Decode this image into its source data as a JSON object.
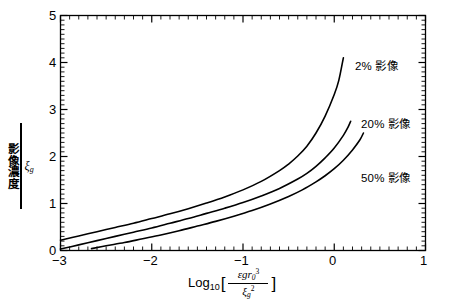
{
  "chart_data": {
    "type": "line",
    "title": "",
    "xlabel": "Log10 [ εgr₀³ / ξ₉² ]",
    "ylabel": "影像濃度 / ξ₉",
    "xlim": [
      -3,
      1
    ],
    "ylim": [
      0,
      5
    ],
    "xticks": [
      -3,
      -2,
      -1,
      0,
      1
    ],
    "xtick_labels": [
      "−3",
      "−2",
      "−1",
      "0",
      "1"
    ],
    "yticks": [
      0,
      1,
      2,
      3,
      4,
      5
    ],
    "ytick_labels": [
      "0",
      "1",
      "2",
      "3",
      "4",
      "5"
    ],
    "x_minor_tick_interval": 0.1,
    "y_minor_tick_interval": 0.1,
    "grid": false,
    "legend_position": "inline-right",
    "series": [
      {
        "name": "2% 影像",
        "label": "2% 影像",
        "color": "#000000",
        "points": [
          [
            -3.0,
            0.22
          ],
          [
            -2.8,
            0.31
          ],
          [
            -2.6,
            0.4
          ],
          [
            -2.4,
            0.49
          ],
          [
            -2.2,
            0.58
          ],
          [
            -2.0,
            0.68
          ],
          [
            -1.8,
            0.78
          ],
          [
            -1.6,
            0.89
          ],
          [
            -1.4,
            1.01
          ],
          [
            -1.2,
            1.14
          ],
          [
            -1.0,
            1.29
          ],
          [
            -0.8,
            1.47
          ],
          [
            -0.6,
            1.7
          ],
          [
            -0.5,
            1.84
          ],
          [
            -0.4,
            2.01
          ],
          [
            -0.3,
            2.22
          ],
          [
            -0.2,
            2.5
          ],
          [
            -0.1,
            2.86
          ],
          [
            0.0,
            3.32
          ],
          [
            0.05,
            3.62
          ],
          [
            0.1,
            4.1
          ]
        ]
      },
      {
        "name": "20% 影像",
        "label": "20% 影像",
        "color": "#000000",
        "points": [
          [
            -3.0,
            0.03
          ],
          [
            -2.8,
            0.12
          ],
          [
            -2.6,
            0.21
          ],
          [
            -2.4,
            0.3
          ],
          [
            -2.2,
            0.39
          ],
          [
            -2.0,
            0.48
          ],
          [
            -1.8,
            0.58
          ],
          [
            -1.6,
            0.68
          ],
          [
            -1.4,
            0.79
          ],
          [
            -1.2,
            0.9
          ],
          [
            -1.0,
            1.02
          ],
          [
            -0.8,
            1.16
          ],
          [
            -0.6,
            1.32
          ],
          [
            -0.4,
            1.52
          ],
          [
            -0.3,
            1.64
          ],
          [
            -0.2,
            1.79
          ],
          [
            -0.1,
            1.97
          ],
          [
            0.0,
            2.18
          ],
          [
            0.1,
            2.45
          ],
          [
            0.15,
            2.62
          ],
          [
            0.18,
            2.75
          ]
        ]
      },
      {
        "name": "50% 影像",
        "label": "50% 影像",
        "color": "#000000",
        "points": [
          [
            -2.66,
            0.04
          ],
          [
            -2.5,
            0.1
          ],
          [
            -2.3,
            0.17
          ],
          [
            -2.1,
            0.25
          ],
          [
            -1.9,
            0.33
          ],
          [
            -1.7,
            0.42
          ],
          [
            -1.5,
            0.52
          ],
          [
            -1.3,
            0.62
          ],
          [
            -1.1,
            0.73
          ],
          [
            -0.9,
            0.85
          ],
          [
            -0.7,
            0.99
          ],
          [
            -0.5,
            1.15
          ],
          [
            -0.35,
            1.29
          ],
          [
            -0.2,
            1.46
          ],
          [
            -0.1,
            1.59
          ],
          [
            0.0,
            1.74
          ],
          [
            0.1,
            1.92
          ],
          [
            0.2,
            2.14
          ],
          [
            0.28,
            2.35
          ],
          [
            0.32,
            2.5
          ]
        ]
      }
    ],
    "annotations": [
      {
        "text": "2% 影像",
        "x": 0.16,
        "y": 4.02
      },
      {
        "text": "20% 影像",
        "x": 0.23,
        "y": 2.78
      },
      {
        "text": "50% 影像",
        "x": 0.23,
        "y": 1.63
      }
    ]
  },
  "axis": {
    "y_label_numerator": "影像濃度",
    "y_label_denominator": "ξ",
    "y_label_denominator_sub": "g",
    "x_label_log": "Log",
    "x_label_log_sub": "10",
    "x_label_bracket_open": "[",
    "x_label_bracket_close": "]",
    "x_label_numerator": "εgr",
    "x_label_numerator_sub": "0",
    "x_label_numerator_sup": "3",
    "x_label_denominator": "ξ",
    "x_label_denominator_sub": "g",
    "x_label_denominator_sup": "2"
  },
  "style": {
    "line_color": "#000000",
    "axis_color": "#000000",
    "background": "#ffffff"
  }
}
